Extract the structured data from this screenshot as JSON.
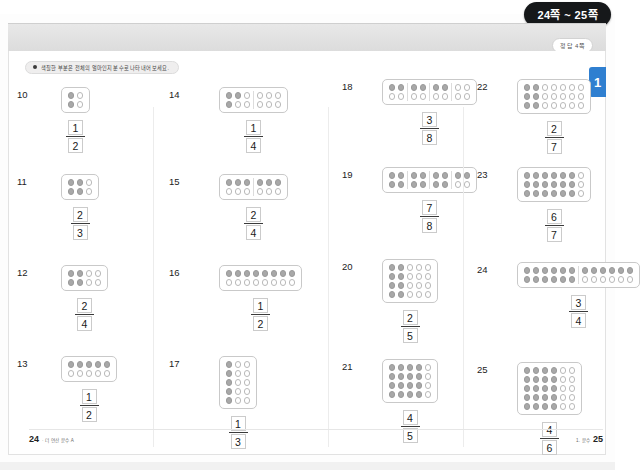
{
  "header": {
    "page_badge": "24쪽 ~ 25쪽",
    "answer_badge": "정답 4쪽",
    "side_tab": "1",
    "instruction": "색칠한 부분은 전체의 얼마인지 분수로 나타내어 보세요."
  },
  "footer": {
    "left_page": "24",
    "left_text": "· 더 연산 분수 A",
    "right_text": "1. 분수",
    "right_page": "25"
  },
  "colors": {
    "badge_bg": "#16181a",
    "tab_blue": "#2f7fd0",
    "circle_fill": "#a8a8a8",
    "circle_empty": "#ffffff",
    "circle_border": "#b9b9b9"
  },
  "columns": [
    {
      "problems": [
        {
          "number": "10",
          "cols": 2,
          "rows": 2,
          "filled": 2,
          "groups": 1,
          "orientation": "column",
          "numerator": "1",
          "denominator": "2"
        },
        {
          "number": "11",
          "cols": 3,
          "rows": 2,
          "filled": 4,
          "groups": 1,
          "orientation": "column",
          "numerator": "2",
          "denominator": "3"
        },
        {
          "number": "12",
          "cols": 4,
          "rows": 2,
          "filled": 4,
          "groups": 1,
          "orientation": "column",
          "numerator": "2",
          "denominator": "4"
        },
        {
          "number": "13",
          "cols": 5,
          "rows": 2,
          "filled": 5,
          "groups": 1,
          "orientation": "row",
          "numerator": "1",
          "denominator": "2"
        }
      ]
    },
    {
      "problems": [
        {
          "number": "14",
          "cols": 6,
          "rows": 2,
          "filled": 3,
          "groups": 2,
          "orientation": "column",
          "numerator": "1",
          "denominator": "4"
        },
        {
          "number": "15",
          "cols": 6,
          "rows": 2,
          "filled": 6,
          "groups": 2,
          "orientation": "row",
          "numerator": "2",
          "denominator": "4"
        },
        {
          "number": "16",
          "cols": 8,
          "rows": 2,
          "filled": 8,
          "groups": 1,
          "orientation": "row",
          "numerator": "1",
          "denominator": "2"
        },
        {
          "number": "17",
          "cols": 3,
          "rows": 5,
          "filled": 5,
          "groups": 1,
          "orientation": "column",
          "numerator": "1",
          "denominator": "3"
        }
      ]
    },
    {
      "problems": [
        {
          "number": "18",
          "cols": 8,
          "rows": 2,
          "filled": 6,
          "groups": 4,
          "orientation": "row",
          "numerator": "3",
          "denominator": "8"
        },
        {
          "number": "19",
          "cols": 8,
          "rows": 2,
          "filled": 14,
          "groups": 4,
          "orientation": "row",
          "numerator": "7",
          "denominator": "8"
        },
        {
          "number": "20",
          "cols": 5,
          "rows": 4,
          "filled": 8,
          "groups": 1,
          "orientation": "column",
          "numerator": "2",
          "denominator": "5"
        },
        {
          "number": "21",
          "cols": 5,
          "rows": 4,
          "filled": 16,
          "groups": 1,
          "orientation": "column",
          "numerator": "4",
          "denominator": "5"
        }
      ]
    },
    {
      "problems": [
        {
          "number": "22",
          "cols": 7,
          "rows": 3,
          "filled": 6,
          "groups": 1,
          "orientation": "column",
          "numerator": "2",
          "denominator": "7"
        },
        {
          "number": "23",
          "cols": 7,
          "rows": 3,
          "filled": 18,
          "groups": 1,
          "orientation": "column",
          "numerator": "6",
          "denominator": "7"
        },
        {
          "number": "24",
          "cols": 12,
          "rows": 2,
          "filled": 18,
          "groups": 2,
          "orientation": "row",
          "numerator": "3",
          "denominator": "4"
        },
        {
          "number": "25",
          "cols": 6,
          "rows": 5,
          "filled": 20,
          "groups": 1,
          "orientation": "column",
          "numerator": "4",
          "denominator": "6"
        }
      ]
    }
  ]
}
